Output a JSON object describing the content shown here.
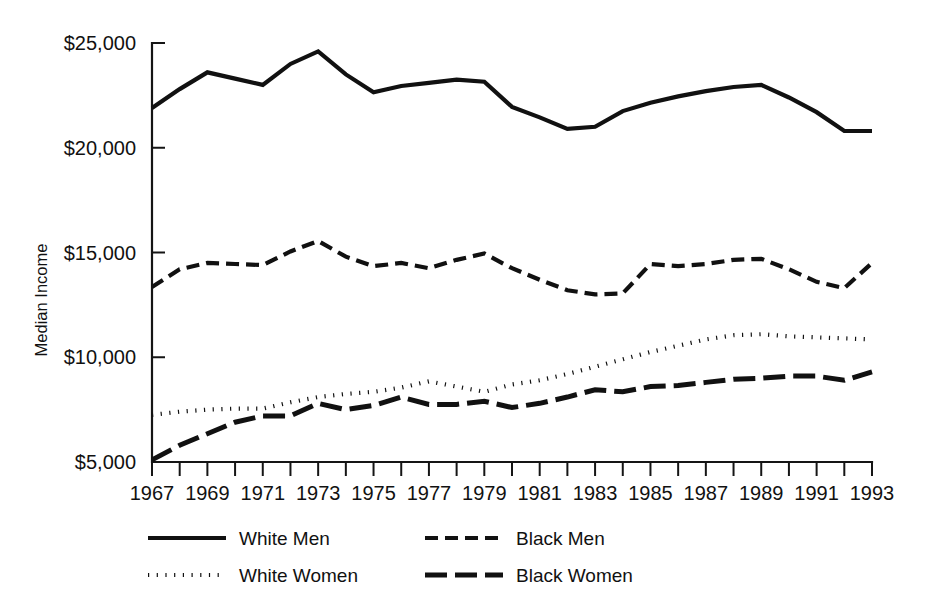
{
  "chart_data": {
    "type": "line",
    "title": "",
    "xlabel": "",
    "ylabel": "Median Income",
    "xlim": [
      1967,
      1993
    ],
    "ylim": [
      5000,
      25000
    ],
    "grid": false,
    "legend_position": "bottom",
    "x": [
      1967,
      1968,
      1969,
      1970,
      1971,
      1972,
      1973,
      1974,
      1975,
      1976,
      1977,
      1978,
      1979,
      1980,
      1981,
      1982,
      1983,
      1984,
      1985,
      1986,
      1987,
      1988,
      1989,
      1990,
      1991,
      1992,
      1993
    ],
    "x_tick_labels": [
      "1967",
      "1969",
      "1971",
      "1973",
      "1975",
      "1977",
      "1979",
      "1981",
      "1983",
      "1985",
      "1987",
      "1989",
      "1991",
      "1993"
    ],
    "y_tick_labels": [
      "$25,000",
      "$20,000",
      "$15,000",
      "$10,000",
      "$5,000"
    ],
    "y_tick_values": [
      25000,
      20000,
      15000,
      10000,
      5000
    ],
    "series": [
      {
        "name": "White Men",
        "style": "solid",
        "values": [
          21900,
          22800,
          23600,
          23300,
          23000,
          24000,
          24600,
          23500,
          22650,
          22950,
          23100,
          23250,
          23150,
          21950,
          21450,
          20900,
          21000,
          21750,
          22150,
          22450,
          22700,
          22900,
          23000,
          22400,
          21700,
          20800,
          20800
        ]
      },
      {
        "name": "Black Men",
        "style": "dashed",
        "values": [
          13350,
          14200,
          14500,
          14450,
          14400,
          15050,
          15550,
          14800,
          14350,
          14500,
          14250,
          14650,
          14950,
          14250,
          13700,
          13200,
          13000,
          13050,
          14450,
          14350,
          14450,
          14650,
          14700,
          14200,
          13600,
          13300,
          14500
        ]
      },
      {
        "name": "White Women",
        "style": "dotted",
        "values": [
          7250,
          7400,
          7500,
          7550,
          7550,
          7850,
          8100,
          8250,
          8350,
          8550,
          8850,
          8600,
          8350,
          8700,
          8900,
          9200,
          9550,
          9900,
          10250,
          10550,
          10850,
          11050,
          11100,
          11000,
          10950,
          10900,
          10850
        ]
      },
      {
        "name": "Black Women",
        "style": "dashdash",
        "values": [
          5100,
          5800,
          6350,
          6900,
          7200,
          7200,
          7800,
          7500,
          7700,
          8100,
          7750,
          7750,
          7900,
          7600,
          7800,
          8100,
          8450,
          8350,
          8600,
          8650,
          8800,
          8950,
          9000,
          9100,
          9100,
          8900,
          9300
        ]
      }
    ]
  },
  "legend": {
    "items": [
      {
        "label": "White Men",
        "style": "solid"
      },
      {
        "label": "Black Men",
        "style": "dashed"
      },
      {
        "label": "White Women",
        "style": "dotted"
      },
      {
        "label": "Black Women",
        "style": "dashdash"
      }
    ]
  },
  "axis": {
    "y_title": "Median Income"
  }
}
